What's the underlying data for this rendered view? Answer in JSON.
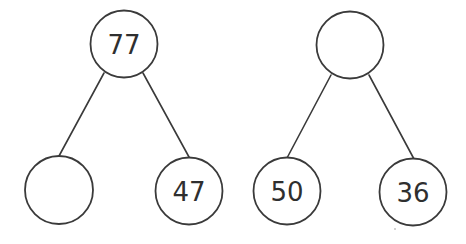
{
  "diagram": {
    "type": "number-bond",
    "trees": [
      {
        "name": "left-tree",
        "top": {
          "value": "77",
          "cx": 124,
          "cy": 44
        },
        "left": {
          "value": "",
          "cx": 59,
          "cy": 190
        },
        "right": {
          "value": "47",
          "cx": 189,
          "cy": 191
        }
      },
      {
        "name": "right-tree",
        "top": {
          "value": "",
          "cx": 350,
          "cy": 45
        },
        "left": {
          "value": "50",
          "cx": 287,
          "cy": 191
        },
        "right": {
          "value": "36",
          "cx": 413,
          "cy": 192
        }
      }
    ]
  }
}
